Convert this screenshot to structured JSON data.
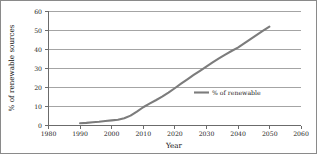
{
  "chart_data": {
    "type": "line",
    "title": "",
    "xlabel": "Year",
    "ylabel": "% of renewable sources",
    "xlim": [
      1980,
      2060
    ],
    "ylim": [
      0,
      60
    ],
    "xticks": [
      "1980",
      "1990",
      "2000",
      "2010",
      "2020",
      "2030",
      "2040",
      "2050",
      "2060"
    ],
    "yticks": [
      "0",
      "10",
      "20",
      "30",
      "40",
      "50",
      "60"
    ],
    "grid": "horizontal",
    "legend_position": "inside-right",
    "line_color": "#7c7c7c",
    "series": [
      {
        "name": "% of renewable",
        "x": [
          1990,
          1992,
          1994,
          1996,
          1998,
          2000,
          2002,
          2004,
          2006,
          2008,
          2010,
          2012,
          2014,
          2016,
          2018,
          2020,
          2022,
          2024,
          2026,
          2028,
          2030,
          2032,
          2034,
          2036,
          2038,
          2040,
          2042,
          2044,
          2046,
          2048,
          2050
        ],
        "values": [
          1.2,
          1.4,
          1.7,
          2.0,
          2.4,
          2.7,
          3.0,
          3.8,
          5.2,
          7.3,
          9.6,
          11.5,
          13.3,
          15.2,
          17.3,
          19.6,
          22.0,
          24.3,
          26.6,
          28.8,
          31.0,
          33.2,
          35.3,
          37.3,
          39.2,
          41.0,
          43.2,
          45.5,
          47.7,
          49.9,
          52.0
        ]
      }
    ]
  },
  "legend": {
    "entries": [
      {
        "label": "% of renewable"
      }
    ]
  }
}
